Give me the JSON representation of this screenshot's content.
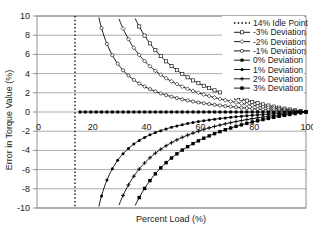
{
  "chart_data": {
    "type": "line",
    "title": "",
    "xlabel": "Percent Load (%)",
    "ylabel": "Error in Torque Value (%)",
    "xlim": [
      0,
      100
    ],
    "ylim": [
      -10,
      10
    ],
    "x_ticks": [
      0,
      20,
      40,
      60,
      80,
      100
    ],
    "y_ticks": [
      10,
      8,
      6,
      4,
      2,
      0,
      -2,
      -4,
      -6,
      -8,
      -10
    ],
    "grid": {
      "horizontal": true,
      "vertical": false
    },
    "legend_position": "upper right inside",
    "idle_point": {
      "label": "14% Idle Point",
      "x": 14,
      "style": "dotted vertical line"
    },
    "model": "error = k * deviation * (100 - load) / (load - 14), k≈1.15; curves drawn from load 16 to 100, clipped to [-10,10]",
    "series": [
      {
        "name": "-3% Deviation",
        "deviation": -3,
        "marker": "open-square",
        "x": [
          36,
          40,
          50,
          60,
          70,
          80,
          90,
          100
        ],
        "y": [
          10,
          8.6,
          5.4,
          3.6,
          2.5,
          1.7,
          0.8,
          0
        ]
      },
      {
        "name": "-2% Deviation",
        "deviation": -2,
        "marker": "open-diamond",
        "x": [
          30,
          40,
          50,
          60,
          70,
          80,
          90,
          100
        ],
        "y": [
          10,
          5.7,
          3.6,
          2.4,
          1.6,
          1.0,
          0.5,
          0
        ]
      },
      {
        "name": "-1% Deviation",
        "deviation": -1,
        "marker": "open-circle",
        "x": [
          23,
          30,
          40,
          50,
          60,
          70,
          80,
          90,
          100
        ],
        "y": [
          10,
          5.0,
          2.9,
          1.8,
          1.2,
          0.8,
          0.5,
          0.25,
          0
        ]
      },
      {
        "name": "0% Deviation",
        "deviation": 0,
        "marker": "star",
        "x": [
          16,
          100
        ],
        "y": [
          0,
          0
        ]
      },
      {
        "name": "1% Deviation",
        "deviation": 1,
        "marker": "filled-circle",
        "x": [
          23,
          30,
          40,
          50,
          60,
          70,
          80,
          90,
          100
        ],
        "y": [
          -10,
          -5.0,
          -2.9,
          -1.8,
          -1.2,
          -0.8,
          -0.5,
          -0.25,
          0
        ]
      },
      {
        "name": "2% Deviation",
        "deviation": 2,
        "marker": "plus",
        "x": [
          30,
          40,
          50,
          60,
          70,
          80,
          90,
          100
        ],
        "y": [
          -10,
          -5.7,
          -3.6,
          -2.4,
          -1.6,
          -1.0,
          -0.5,
          0
        ]
      },
      {
        "name": "3% Deviation",
        "deviation": 3,
        "marker": "filled-square",
        "x": [
          36,
          40,
          50,
          60,
          70,
          80,
          90,
          100
        ],
        "y": [
          -10,
          -8.6,
          -5.4,
          -3.6,
          -2.5,
          -1.7,
          -0.8,
          0
        ]
      }
    ]
  },
  "legend": {
    "items": [
      "14% Idle Point",
      "-3% Deviation",
      "-2% Deviation",
      "-1% Deviation",
      "0% Deviation",
      "1% Deviation",
      "2% Deviation",
      "3% Deviation"
    ]
  },
  "axes": {
    "x_title": "Percent Load (%)",
    "y_title": "Error in Torque Value (%)",
    "x_tick_labels": [
      "0",
      "20",
      "40",
      "60",
      "80",
      "100"
    ],
    "y_tick_labels": [
      "10",
      "8",
      "6",
      "4",
      "2",
      "0",
      "-2",
      "-4",
      "-6",
      "-8",
      "-10"
    ]
  }
}
